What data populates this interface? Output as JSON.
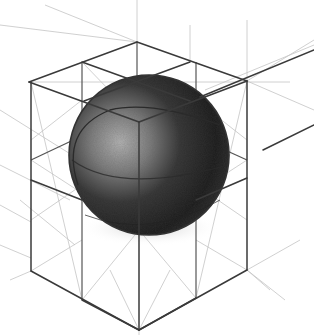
{
  "artwork": {
    "subject": "Pencil sketch of a shaded sphere inscribed in a wireframe cube",
    "medium": "graphite pencil",
    "colors": {
      "paper": "#ffffff",
      "line_dark": "#3a3a3a",
      "line_light": "#b8b8b8",
      "sphere_dark": "#1e1e1e",
      "sphere_light": "#9a9a9a"
    }
  }
}
